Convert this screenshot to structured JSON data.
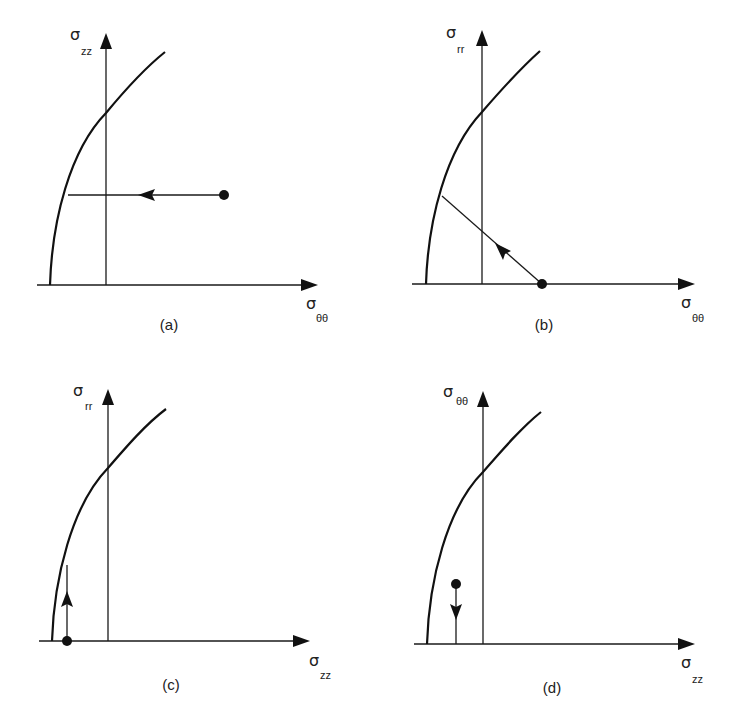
{
  "figure": {
    "panels": [
      {
        "id": "a",
        "caption": "(a)",
        "y_axis": {
          "symbol": "σ",
          "subscript": "zz"
        },
        "x_axis": {
          "symbol": "σ",
          "subscript": "θθ"
        },
        "path_direction": "horizontal, leftward toward yield curve"
      },
      {
        "id": "b",
        "caption": "(b)",
        "y_axis": {
          "symbol": "σ",
          "subscript": "rr"
        },
        "x_axis": {
          "symbol": "σ",
          "subscript": "θθ"
        },
        "path_direction": "diagonal, up-left toward yield curve"
      },
      {
        "id": "c",
        "caption": "(c)",
        "y_axis": {
          "symbol": "σ",
          "subscript": "rr"
        },
        "x_axis": {
          "symbol": "σ",
          "subscript": "zz"
        },
        "path_direction": "vertical, upward toward yield curve"
      },
      {
        "id": "d",
        "caption": "(d)",
        "y_axis": {
          "symbol": "σ",
          "subscript": "θθ"
        },
        "x_axis": {
          "symbol": "σ",
          "subscript": "zz"
        },
        "path_direction": "vertical, downward toward horizontal axis"
      }
    ]
  },
  "colors": {
    "line": "#1a1a1a",
    "background": "#ffffff"
  }
}
